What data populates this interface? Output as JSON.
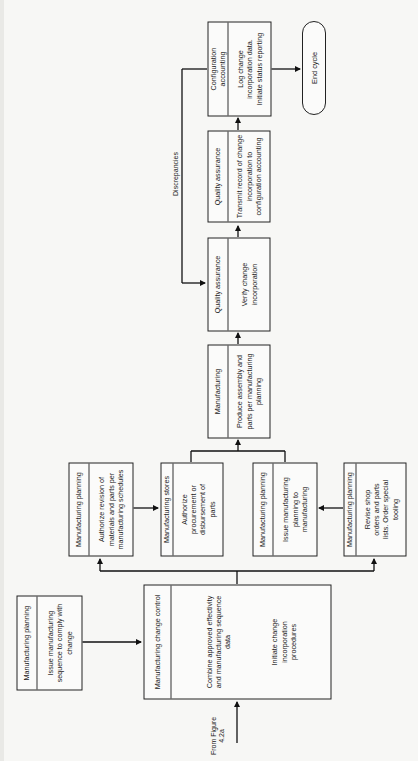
{
  "diagram": {
    "type": "flowchart",
    "orientation": "rotated-90-ccw",
    "boxes": [
      {
        "id": "mp_issue_sequence",
        "header": "Manufacturing planning",
        "body": [
          "Issue manufacturing sequence to comply with change"
        ]
      },
      {
        "id": "mcc",
        "header": "Manufacturing change control",
        "body": [
          "Combine approved effectivity and manufacturing sequence data",
          "Initiate change incorporation procedures"
        ]
      },
      {
        "id": "mp_authorize_revision",
        "header": "Manufacturing planning",
        "body": [
          "Authorize revision of materials and parts per manufacturing schedules"
        ]
      },
      {
        "id": "stores",
        "header": "Manufacturing stores",
        "body": [
          "Authorize procurement or disbursement of parts"
        ]
      },
      {
        "id": "mp_issue_planning",
        "header": "Manufacturing planning",
        "body": [
          "Issue manufacturing planning to manufacturing"
        ]
      },
      {
        "id": "mp_revise_shop",
        "header": "Manufacturing planning",
        "body": [
          "Revise shop orders and parts lists. Order special tooling"
        ]
      },
      {
        "id": "manufacturing",
        "header": "Manufacturing",
        "body": [
          "Produce assembly and parts per manufacturing planning"
        ]
      },
      {
        "id": "qa_verify",
        "header": "Quality assurance",
        "body": [
          "Verify change incorporation"
        ]
      },
      {
        "id": "qa_transmit",
        "header": "Quality assurance",
        "body": [
          "Transmit record of change incorporation to configuration accounting"
        ]
      },
      {
        "id": "config",
        "header": "Configuration accounting",
        "body": [
          "Log change incorporation data. Initiate status reporting"
        ]
      }
    ],
    "terminal": {
      "id": "end",
      "label": "End cycle"
    },
    "labels": {
      "from": "From Figure 4.2a",
      "discrepancies": "Discrepancies"
    },
    "edges": [
      [
        "From Figure 4.2a",
        "mcc"
      ],
      [
        "mp_issue_sequence",
        "mcc"
      ],
      [
        "mcc",
        "mp_authorize_revision"
      ],
      [
        "mcc",
        "mp_revise_shop"
      ],
      [
        "mp_authorize_revision",
        "stores"
      ],
      [
        "mp_revise_shop",
        "mp_issue_planning"
      ],
      [
        "stores",
        "manufacturing"
      ],
      [
        "mp_issue_planning",
        "manufacturing"
      ],
      [
        "manufacturing",
        "qa_verify"
      ],
      [
        "qa_verify",
        "qa_transmit"
      ],
      [
        "qa_transmit",
        "config"
      ],
      [
        "config",
        "qa_verify",
        "Discrepancies"
      ],
      [
        "config",
        "end"
      ]
    ]
  }
}
